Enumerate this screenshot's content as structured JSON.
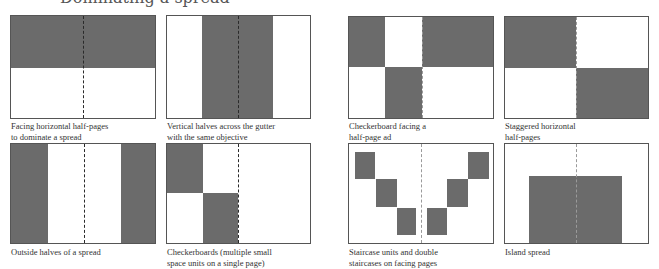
{
  "header": {
    "title": "Dominating a spread"
  },
  "panels": [
    {
      "id": "facing-horizontal-half-pages",
      "caption_line1": "Facing horizontal half-pages",
      "caption_line2": "to dominate a spread"
    },
    {
      "id": "vertical-halves-across-gutter",
      "caption_line1": "Vertical halves across the gutter",
      "caption_line2": "with the same objective"
    },
    {
      "id": "checkerboard-facing-half-page-ad",
      "caption_line1": "Checkerboard facing a",
      "caption_line2": "half-page ad"
    },
    {
      "id": "staggered-horizontal-half-pages",
      "caption_line1": "Staggered horizontal",
      "caption_line2": "half-pages"
    },
    {
      "id": "outside-halves-of-spread",
      "caption_line1": "Outside halves of a spread",
      "caption_line2": ""
    },
    {
      "id": "checkerboards-multiple-small-units",
      "caption_line1": "Checkerboards (multiple small",
      "caption_line2": "space units on a single page)"
    },
    {
      "id": "staircase-units",
      "caption_line1": "Staircase units and double",
      "caption_line2": "staircases on facing pages"
    },
    {
      "id": "island-spread",
      "caption_line1": "Island spread",
      "caption_line2": ""
    }
  ],
  "colors": {
    "ad_fill": "#6b6b6b",
    "page_border": "#555555",
    "gutter": "#2a2a2a",
    "background": "#ffffff"
  }
}
